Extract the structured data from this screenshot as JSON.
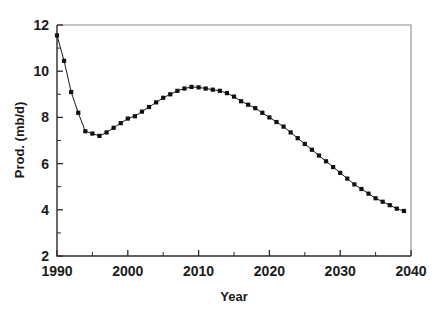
{
  "chart_data": {
    "type": "line",
    "title": "",
    "subtitle": "",
    "xlabel": "Year",
    "ylabel": "Prod. (mb/d)",
    "xlim": [
      1990,
      2040
    ],
    "ylim": [
      2,
      12
    ],
    "x_major_ticks": [
      1990,
      2000,
      2010,
      2020,
      2030,
      2040
    ],
    "x_minor_ticks": [
      1995,
      2005,
      2015,
      2025,
      2035
    ],
    "x_tick_labels": [
      "1990",
      "2000",
      "2010",
      "2020",
      "2030",
      "2040"
    ],
    "y_major_ticks": [
      2,
      4,
      6,
      8,
      10,
      12
    ],
    "y_minor_ticks": [
      3,
      5,
      7,
      9,
      11
    ],
    "y_tick_labels": [
      "2",
      "4",
      "6",
      "8",
      "10",
      "12"
    ],
    "grid": false,
    "legend": false,
    "legend_position": "none",
    "marker": "square",
    "marker_color": "#111111",
    "line_color": "#1b1b1b",
    "x": [
      1990,
      1991,
      1992,
      1993,
      1994,
      1995,
      1996,
      1997,
      1998,
      1999,
      2000,
      2001,
      2002,
      2003,
      2004,
      2005,
      2006,
      2007,
      2008,
      2009,
      2010,
      2011,
      2012,
      2013,
      2014,
      2015,
      2016,
      2017,
      2018,
      2019,
      2020,
      2021,
      2022,
      2023,
      2024,
      2025,
      2026,
      2027,
      2028,
      2029,
      2030,
      2031,
      2032,
      2033,
      2034,
      2035,
      2036,
      2037,
      2038,
      2039
    ],
    "series": [
      {
        "name": "Prod. (mb/d)",
        "values": [
          11.55,
          10.45,
          9.1,
          8.2,
          7.4,
          7.3,
          7.2,
          7.35,
          7.55,
          7.75,
          7.95,
          8.05,
          8.25,
          8.45,
          8.65,
          8.85,
          9.0,
          9.15,
          9.25,
          9.32,
          9.3,
          9.25,
          9.2,
          9.15,
          9.05,
          8.9,
          8.7,
          8.55,
          8.4,
          8.2,
          8.0,
          7.8,
          7.6,
          7.35,
          7.1,
          6.85,
          6.6,
          6.35,
          6.1,
          5.85,
          5.6,
          5.35,
          5.1,
          4.9,
          4.7,
          4.5,
          4.35,
          4.2,
          4.05,
          3.95
        ]
      }
    ]
  },
  "axes": {
    "y_axis_title": "Prod. (mb/d)",
    "x_axis_title": "Year"
  }
}
